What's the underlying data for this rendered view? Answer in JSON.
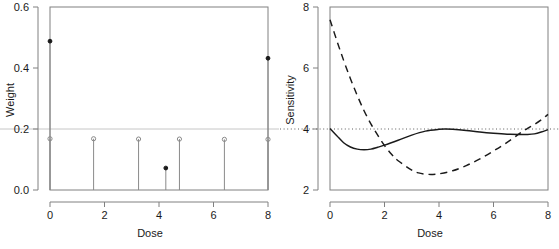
{
  "figure": {
    "background": "#ffffff",
    "panels": 2,
    "ink_color": "#1a1a1a",
    "frame_color": "#808080",
    "reference_line_color": "#9a9a9a"
  },
  "chart_data": [
    {
      "type": "scatter",
      "panel": "left",
      "title": "",
      "xlabel": "Dose",
      "ylabel": "Weight",
      "xlim": [
        0,
        8
      ],
      "ylim": [
        0.0,
        0.6
      ],
      "xticks": [
        0,
        2,
        4,
        6,
        8
      ],
      "xtick_labels": [
        "0",
        "2",
        "4",
        "6",
        "8"
      ],
      "yticks": [
        0.0,
        0.2,
        0.4,
        0.6
      ],
      "ytick_labels": [
        "0.0",
        "0.2",
        "0.4",
        "0.6"
      ],
      "grid": false,
      "reference_lines": [
        {
          "orientation": "horizontal",
          "y": 0.2,
          "style": "solid-faint"
        }
      ],
      "legend": "none",
      "series": [
        {
          "name": "design-weights-open",
          "marker": "open-circle",
          "stems": true,
          "points": [
            {
              "x": 0.0,
              "y": 0.168
            },
            {
              "x": 1.6,
              "y": 0.168
            },
            {
              "x": 3.25,
              "y": 0.167
            },
            {
              "x": 4.75,
              "y": 0.167
            },
            {
              "x": 6.4,
              "y": 0.166
            },
            {
              "x": 8.0,
              "y": 0.166
            }
          ]
        },
        {
          "name": "design-weights-filled",
          "marker": "filled-circle",
          "stems": true,
          "points": [
            {
              "x": 0.0,
              "y": 0.488
            },
            {
              "x": 4.25,
              "y": 0.072
            },
            {
              "x": 8.0,
              "y": 0.432
            }
          ]
        }
      ]
    },
    {
      "type": "line",
      "panel": "right",
      "title": "",
      "xlabel": "Dose",
      "ylabel": "Sensitivity",
      "xlim": [
        0,
        8
      ],
      "ylim": [
        2,
        8
      ],
      "xticks": [
        0,
        2,
        4,
        6,
        8
      ],
      "xtick_labels": [
        "0",
        "2",
        "4",
        "6",
        "8"
      ],
      "yticks": [
        2,
        4,
        6,
        8
      ],
      "ytick_labels": [
        "2",
        "4",
        "6",
        "8"
      ],
      "grid": false,
      "reference_lines": [
        {
          "orientation": "horizontal",
          "y": 4,
          "style": "dotted"
        }
      ],
      "legend": "none",
      "series": [
        {
          "name": "sensitivity-solid",
          "style": "solid",
          "x": [
            0.0,
            0.25,
            0.5,
            0.75,
            1.0,
            1.25,
            1.5,
            1.75,
            2.0,
            2.5,
            3.0,
            3.5,
            4.0,
            4.25,
            4.5,
            5.0,
            5.5,
            6.0,
            6.5,
            7.0,
            7.25,
            7.5,
            7.75,
            8.0
          ],
          "y": [
            4.02,
            3.78,
            3.55,
            3.41,
            3.34,
            3.32,
            3.34,
            3.4,
            3.47,
            3.63,
            3.8,
            3.93,
            3.99,
            4.0,
            3.99,
            3.95,
            3.9,
            3.86,
            3.83,
            3.82,
            3.82,
            3.84,
            3.9,
            3.98
          ]
        },
        {
          "name": "sensitivity-dashed",
          "style": "dashed",
          "x": [
            0.0,
            0.25,
            0.5,
            0.75,
            1.0,
            1.25,
            1.5,
            1.75,
            2.0,
            2.25,
            2.5,
            3.0,
            3.25,
            3.5,
            3.75,
            4.0,
            4.5,
            5.0,
            5.5,
            6.0,
            6.5,
            7.0,
            7.25,
            7.5,
            7.75,
            8.0
          ],
          "y": [
            7.58,
            6.9,
            6.25,
            5.65,
            5.1,
            4.6,
            4.17,
            3.8,
            3.46,
            3.18,
            2.96,
            2.65,
            2.56,
            2.52,
            2.51,
            2.53,
            2.63,
            2.8,
            3.02,
            3.28,
            3.56,
            3.88,
            4.02,
            4.15,
            4.3,
            4.48
          ]
        }
      ]
    }
  ]
}
